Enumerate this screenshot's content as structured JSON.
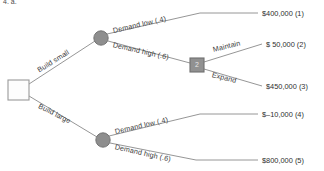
{
  "header": {
    "text": "4.  a."
  },
  "diagram": {
    "type": "decision-tree",
    "nodes": [
      {
        "id": "root",
        "kind": "decision",
        "label": "",
        "x": 18,
        "y": 90
      },
      {
        "id": "chance-small",
        "kind": "chance",
        "label": "",
        "x": 101,
        "y": 38
      },
      {
        "id": "decision-2",
        "kind": "decision",
        "label": "2",
        "x": 197,
        "y": 65
      },
      {
        "id": "chance-large",
        "kind": "chance",
        "label": "",
        "x": 103,
        "y": 140
      }
    ],
    "branches": [
      {
        "id": "build-small",
        "label": "Build small",
        "from": "root",
        "to": "chance-small",
        "rotate": -32
      },
      {
        "id": "build-large",
        "label": "Build large",
        "from": "root",
        "to": "chance-large",
        "rotate": 27
      },
      {
        "id": "small-demand-low",
        "label": "Demand low (.4)",
        "from": "chance-small",
        "to": "outcome-1",
        "rotate": -13
      },
      {
        "id": "small-demand-high",
        "label": "Demand high (.6)",
        "from": "chance-small",
        "to": "decision-2",
        "rotate": 13
      },
      {
        "id": "maintain",
        "label": "Maintain",
        "from": "decision-2",
        "to": "outcome-2",
        "rotate": -14
      },
      {
        "id": "expand",
        "label": "Expand",
        "from": "decision-2",
        "to": "outcome-3",
        "rotate": 14
      },
      {
        "id": "large-demand-low",
        "label": "Demand low (.4)",
        "from": "chance-large",
        "to": "outcome-4",
        "rotate": -13
      },
      {
        "id": "large-demand-high",
        "label": "Demand high (.6)",
        "from": "chance-large",
        "to": "outcome-5",
        "rotate": 13
      }
    ],
    "outcomes": [
      {
        "id": "outcome-1",
        "payoff": "$400,000 (1)",
        "x": 262,
        "y": 9
      },
      {
        "id": "outcome-2",
        "payoff": "$  50,000 (2)",
        "x": 267,
        "y": 40
      },
      {
        "id": "outcome-3",
        "payoff": "$450,000 (3)",
        "x": 267,
        "y": 83
      },
      {
        "id": "outcome-4",
        "payoff": "$–10,000 (4)",
        "x": 262,
        "y": 110
      },
      {
        "id": "outcome-5",
        "payoff": "$800,000 (5)",
        "x": 262,
        "y": 155
      }
    ]
  }
}
